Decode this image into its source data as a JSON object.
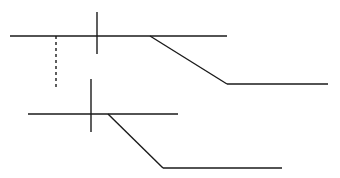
{
  "diagram": {
    "background": "#ffffff",
    "stroke_color": "#1a1a1a",
    "stroke_width": 1.4,
    "groups": [
      {
        "name": "upper-track",
        "baseline": {
          "x1": 10,
          "y1": 36,
          "x2": 227,
          "y2": 36
        },
        "cross_tick": {
          "x1": 97,
          "y1": 12,
          "x2": 97,
          "y2": 54
        },
        "dashed_drop": {
          "x1": 56,
          "y1": 36,
          "x2": 56,
          "y2": 88
        },
        "diagonal": {
          "x1": 150,
          "y1": 36,
          "x2": 227,
          "y2": 84
        },
        "lower_run": {
          "x1": 227,
          "y1": 84,
          "x2": 328,
          "y2": 84
        }
      },
      {
        "name": "lower-track",
        "baseline": {
          "x1": 28,
          "y1": 114,
          "x2": 178,
          "y2": 114
        },
        "cross_tick": {
          "x1": 91,
          "y1": 79,
          "x2": 91,
          "y2": 132
        },
        "diagonal": {
          "x1": 108,
          "y1": 114,
          "x2": 163,
          "y2": 168
        },
        "lower_run": {
          "x1": 163,
          "y1": 168,
          "x2": 282,
          "y2": 168
        }
      }
    ]
  }
}
